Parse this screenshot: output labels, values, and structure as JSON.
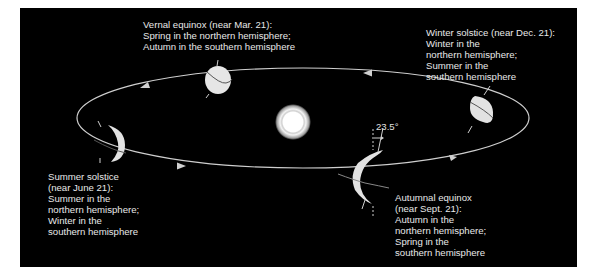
{
  "diagram": {
    "colors": {
      "background": "#000000",
      "frame": "#ffffff",
      "orbit": "#cfcfcf",
      "earth": "#d9d9d9",
      "text": "#e8e8e8"
    },
    "tilt_label": "23.5°",
    "positions": [
      {
        "id": "vernal",
        "lines": [
          "Vernal equinox (near Mar. 21):",
          "Spring in the northern hemisphere;",
          "Autumn in the southern hemisphere"
        ]
      },
      {
        "id": "winter",
        "lines": [
          "Winter solstice (near Dec. 21):",
          "Winter in the",
          "northern hemisphere;",
          "Summer in the",
          "southern hemisphere"
        ]
      },
      {
        "id": "summer",
        "lines": [
          "Summer solstice",
          "(near June 21):",
          "Summer in the",
          "northern hemisphere;",
          "Winter in the",
          "southern hemisphere"
        ]
      },
      {
        "id": "autumnal",
        "lines": [
          "Autumnal equinox",
          "(near Sept. 21):",
          "Autumn in the",
          "northern hemisphere;",
          "Spring in the",
          "southern hemisphere"
        ]
      }
    ]
  }
}
